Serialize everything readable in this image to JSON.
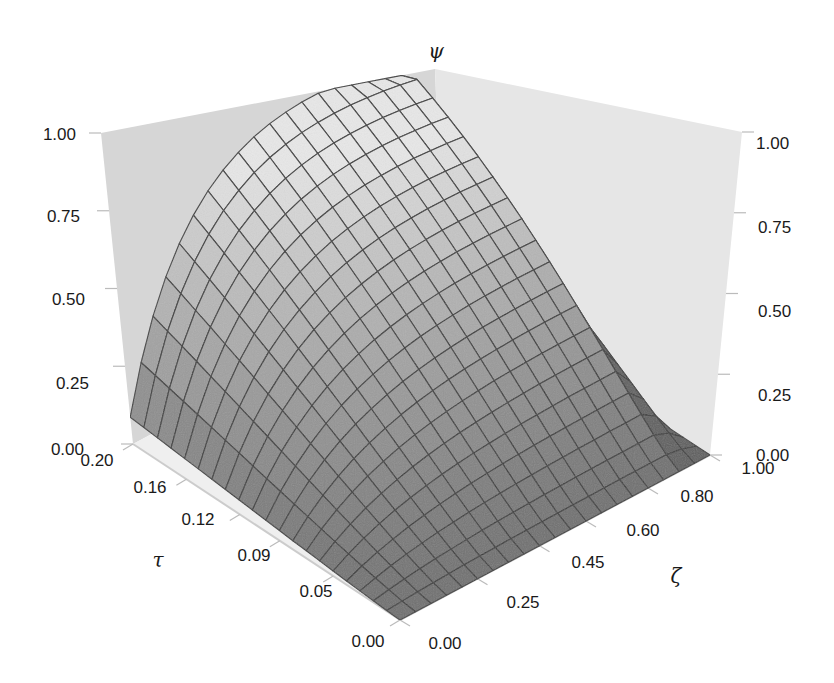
{
  "chart_data": {
    "type": "surface3d",
    "title": "",
    "axes": {
      "x": {
        "name": "tau",
        "label": "τ",
        "ticks": [
          "0.00",
          "0.05",
          "0.09",
          "0.12",
          "0.16",
          "0.20"
        ],
        "range": [
          0.0,
          0.2
        ]
      },
      "y": {
        "name": "zeta",
        "label": "ζ",
        "ticks": [
          "0.00",
          "0.25",
          "0.45",
          "0.60",
          "0.80",
          "1.00"
        ],
        "range": [
          0.0,
          1.0
        ]
      },
      "z": {
        "name": "psi",
        "label": "ψ",
        "ticks": [
          "0.00",
          "0.25",
          "0.50",
          "0.75",
          "1.00"
        ],
        "range": [
          0.0,
          1.0
        ]
      }
    },
    "z_tick_labels_left": [
      "1.00",
      "0.75",
      "0.50",
      "0.25",
      "0.00"
    ],
    "z_tick_labels_right": [
      "1.00",
      "0.75",
      "0.50",
      "0.25",
      "0.00"
    ],
    "grid": {
      "tau_lines": 20,
      "zeta_lines": 20
    },
    "surface_description": "psi increases with tau and with zeta; near 0 at tau=0, approaches 1 at tau=0.20 for large zeta, and drops steeply to 0 as zeta approaches 1.00",
    "sample_values": [
      {
        "tau": 0.0,
        "zeta": 0.0,
        "psi": 0.0
      },
      {
        "tau": 0.2,
        "zeta": 0.0,
        "psi": 0.08
      },
      {
        "tau": 0.2,
        "zeta": 0.5,
        "psi": 0.85
      },
      {
        "tau": 0.2,
        "zeta": 0.9,
        "psi": 1.0
      },
      {
        "tau": 0.2,
        "zeta": 1.0,
        "psi": 0.0
      },
      {
        "tau": 0.1,
        "zeta": 0.5,
        "psi": 0.3
      },
      {
        "tau": 0.0,
        "zeta": 1.0,
        "psi": 0.0
      }
    ],
    "colors": {
      "surface_dark": "#6e6e6e",
      "surface_light": "#e4e4e4",
      "wall": "#d6d6d6",
      "grid_line": "#3a3a3a",
      "text": "#1a1a1a"
    }
  }
}
